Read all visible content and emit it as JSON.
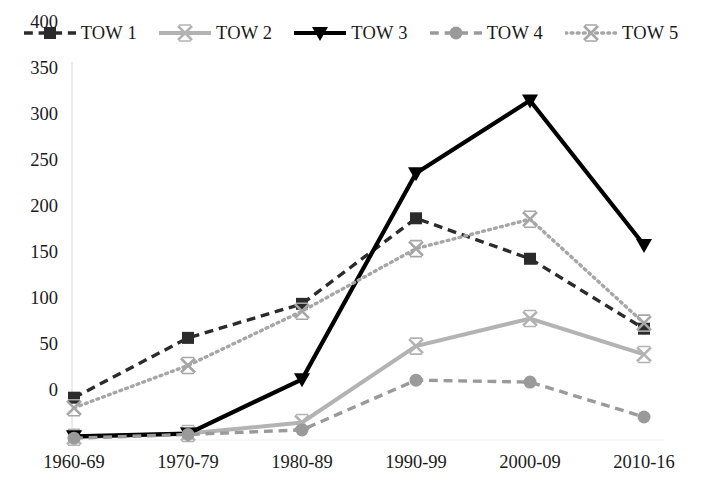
{
  "chart_data": {
    "type": "line",
    "title": "",
    "xlabel": "",
    "ylabel": "",
    "categories": [
      "1960-69",
      "1970-79",
      "1980-89",
      "1990-99",
      "2000-09",
      "2010-16"
    ],
    "yticks": [
      0,
      50,
      100,
      150,
      200,
      250,
      300,
      350,
      400
    ],
    "ylim": [
      0,
      400
    ],
    "grid": false,
    "legend_position": "top",
    "series": [
      {
        "name": "TOW 1",
        "values": [
          46,
          111,
          148,
          241,
          197,
          121
        ],
        "color": "#2b2b2b",
        "line_style": "dashed",
        "marker": "square"
      },
      {
        "name": "TOW 2",
        "values": [
          3,
          7,
          19,
          102,
          132,
          93
        ],
        "color": "#b3b3b3",
        "line_style": "solid",
        "marker": "x"
      },
      {
        "name": "TOW 3",
        "values": [
          4,
          7,
          66,
          290,
          369,
          212
        ],
        "color": "#000000",
        "line_style": "solid",
        "marker": "triangle-down"
      },
      {
        "name": "TOW 4",
        "values": [
          2,
          6,
          11,
          65,
          63,
          25
        ],
        "color": "#9a9a9a",
        "line_style": "dashed",
        "marker": "circle"
      },
      {
        "name": "TOW 5",
        "values": [
          35,
          81,
          140,
          208,
          240,
          127
        ],
        "color": "#a6a6a6",
        "line_style": "dotted",
        "marker": "x"
      }
    ]
  },
  "axis": {
    "ytick_labels": [
      "400",
      "350",
      "300",
      "250",
      "200",
      "150",
      "100",
      "50",
      "0"
    ],
    "xtick_labels": [
      "1960-69",
      "1970-79",
      "1980-89",
      "1990-99",
      "2000-09",
      "2010-16"
    ]
  },
  "legend": {
    "items": [
      {
        "label": "TOW 1"
      },
      {
        "label": "TOW 2"
      },
      {
        "label": "TOW 3"
      },
      {
        "label": "TOW 4"
      },
      {
        "label": "TOW 5"
      }
    ]
  }
}
